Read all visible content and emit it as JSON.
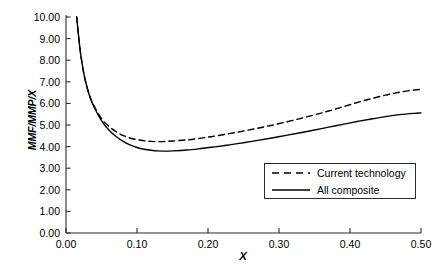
{
  "chart_data": {
    "type": "line",
    "title": "",
    "xlabel": "X",
    "ylabel": "MMF/MMP/X",
    "xlim": [
      0.0,
      0.5
    ],
    "ylim": [
      0.0,
      10.0
    ],
    "xticks": [
      "0.00",
      "0.10",
      "0.20",
      "0.30",
      "0.40",
      "0.50"
    ],
    "xtick_values": [
      0.0,
      0.1,
      0.2,
      0.3,
      0.4,
      0.5
    ],
    "yticks": [
      "0.00",
      "1.00",
      "2.00",
      "3.00",
      "4.00",
      "5.00",
      "6.00",
      "7.00",
      "8.00",
      "9.00",
      "10.00"
    ],
    "ytick_values": [
      0,
      1,
      2,
      3,
      4,
      5,
      6,
      7,
      8,
      9,
      10
    ],
    "grid": false,
    "legend_position": "lower-right",
    "series": [
      {
        "name": "Current technology",
        "style": "dashed",
        "color": "#000000",
        "x": [
          0.015,
          0.02,
          0.025,
          0.03,
          0.035,
          0.04,
          0.05,
          0.06,
          0.07,
          0.08,
          0.09,
          0.1,
          0.11,
          0.12,
          0.13,
          0.14,
          0.15,
          0.17,
          0.19,
          0.21,
          0.23,
          0.25,
          0.27,
          0.29,
          0.31,
          0.33,
          0.35,
          0.37,
          0.39,
          0.41,
          0.43,
          0.45,
          0.47,
          0.49,
          0.5
        ],
        "values": [
          10.0,
          8.45,
          7.4,
          6.7,
          6.2,
          5.85,
          5.3,
          4.95,
          4.7,
          4.52,
          4.4,
          4.32,
          4.27,
          4.24,
          4.23,
          4.24,
          4.26,
          4.31,
          4.39,
          4.49,
          4.6,
          4.72,
          4.85,
          4.99,
          5.14,
          5.3,
          5.47,
          5.65,
          5.84,
          6.04,
          6.22,
          6.38,
          6.52,
          6.62,
          6.65
        ]
      },
      {
        "name": "All composite",
        "style": "solid",
        "color": "#000000",
        "x": [
          0.015,
          0.02,
          0.025,
          0.03,
          0.035,
          0.04,
          0.05,
          0.06,
          0.07,
          0.08,
          0.09,
          0.1,
          0.11,
          0.12,
          0.13,
          0.14,
          0.15,
          0.17,
          0.19,
          0.21,
          0.23,
          0.25,
          0.27,
          0.29,
          0.31,
          0.33,
          0.35,
          0.37,
          0.39,
          0.41,
          0.43,
          0.45,
          0.47,
          0.49,
          0.5
        ],
        "values": [
          10.0,
          8.45,
          7.4,
          6.7,
          6.18,
          5.8,
          5.2,
          4.78,
          4.48,
          4.25,
          4.08,
          3.96,
          3.88,
          3.83,
          3.8,
          3.79,
          3.8,
          3.84,
          3.91,
          3.99,
          4.08,
          4.18,
          4.29,
          4.4,
          4.52,
          4.64,
          4.77,
          4.9,
          5.03,
          5.16,
          5.28,
          5.39,
          5.48,
          5.54,
          5.56
        ]
      }
    ]
  },
  "axes": {
    "ylabel_text": "MMF/MMP/X",
    "xlabel_text": "X"
  },
  "legend": {
    "entries": [
      {
        "label": "Current technology",
        "style": "dashed"
      },
      {
        "label": "All composite",
        "style": "solid"
      }
    ]
  }
}
